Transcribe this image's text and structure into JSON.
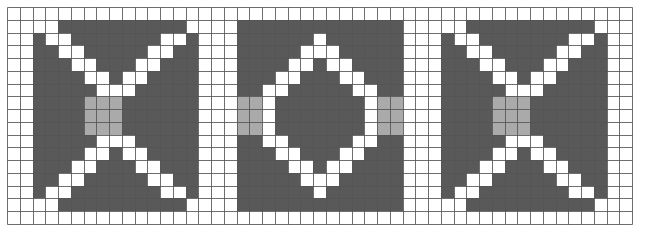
{
  "figure": {
    "title": "",
    "background_color": "#ffffff",
    "width": 647,
    "height": 232
  },
  "grid": {
    "origin_x": 7,
    "origin_y": 7,
    "cell_size": 12.76,
    "columns": 49,
    "rows": 17,
    "line_color": "#555555",
    "line_width": 1,
    "grid_visible": true
  },
  "palette": {
    "empty": "#ffffff",
    "dark": "#595959",
    "mid": "#aaaaaa",
    "highlight": "#ffffff",
    "border": "#555555"
  },
  "chart_data": {
    "type": "heatmap",
    "title": "",
    "subtitle": "",
    "xlabel": "",
    "ylabel": "",
    "legend": [],
    "grid": true,
    "legend_position": "none",
    "xlim": [
      0,
      49
    ],
    "ylim": [
      0,
      17
    ],
    "value_labels": {
      "0": "empty",
      "1": "dark",
      "2": "mid",
      "3": "highlight"
    },
    "value_colors": {
      "0": "#ffffff",
      "1": "#595959",
      "2": "#aaaaaa",
      "3": "#ffffff"
    },
    "panels": [
      {
        "name": "panel-left-bowtie",
        "col_offset": 2,
        "row_offset": 1,
        "width": 13,
        "height": 15
      },
      {
        "name": "panel-middle-diamond",
        "col_offset": 18,
        "row_offset": 1,
        "width": 13,
        "height": 15
      },
      {
        "name": "panel-right-bowtie",
        "col_offset": 34,
        "row_offset": 1,
        "width": 13,
        "height": 15
      }
    ],
    "cells": [
      [
        0,
        0,
        0,
        0,
        0,
        0,
        0,
        0,
        0,
        0,
        0,
        0,
        0,
        0,
        0,
        0,
        0,
        0,
        0,
        0,
        0,
        0,
        0,
        0,
        0,
        0,
        0,
        0,
        0,
        0,
        0,
        0,
        0,
        0,
        0,
        0,
        0,
        0,
        0,
        0,
        0,
        0,
        0,
        0,
        0,
        0,
        0,
        0,
        0
      ],
      [
        0,
        0,
        0,
        0,
        1,
        1,
        1,
        1,
        1,
        1,
        1,
        1,
        1,
        1,
        0,
        0,
        0,
        0,
        1,
        1,
        1,
        1,
        1,
        1,
        1,
        1,
        1,
        1,
        1,
        1,
        1,
        0,
        0,
        0,
        0,
        0,
        1,
        1,
        1,
        1,
        1,
        1,
        1,
        1,
        1,
        1,
        0,
        0,
        0
      ],
      [
        0,
        0,
        1,
        3,
        3,
        1,
        1,
        1,
        1,
        1,
        1,
        1,
        3,
        3,
        1,
        0,
        0,
        0,
        1,
        1,
        1,
        1,
        1,
        1,
        3,
        1,
        1,
        1,
        1,
        1,
        1,
        0,
        0,
        0,
        1,
        3,
        3,
        1,
        1,
        1,
        1,
        1,
        1,
        1,
        3,
        3,
        1,
        0,
        0
      ],
      [
        0,
        0,
        1,
        1,
        3,
        3,
        1,
        1,
        1,
        1,
        1,
        3,
        3,
        1,
        1,
        0,
        0,
        0,
        1,
        1,
        1,
        1,
        1,
        3,
        3,
        3,
        1,
        1,
        1,
        1,
        1,
        0,
        0,
        0,
        1,
        1,
        3,
        3,
        1,
        1,
        1,
        1,
        1,
        3,
        3,
        1,
        1,
        0,
        0
      ],
      [
        0,
        0,
        1,
        1,
        1,
        3,
        3,
        1,
        1,
        1,
        3,
        3,
        1,
        1,
        1,
        0,
        0,
        0,
        1,
        1,
        1,
        1,
        3,
        3,
        1,
        3,
        3,
        1,
        1,
        1,
        1,
        0,
        0,
        0,
        1,
        1,
        1,
        3,
        3,
        1,
        1,
        1,
        3,
        3,
        1,
        1,
        1,
        0,
        0
      ],
      [
        0,
        0,
        1,
        1,
        1,
        1,
        3,
        3,
        1,
        3,
        3,
        1,
        1,
        1,
        1,
        0,
        0,
        0,
        1,
        1,
        1,
        3,
        3,
        1,
        1,
        1,
        3,
        3,
        1,
        1,
        1,
        0,
        0,
        0,
        1,
        1,
        1,
        1,
        3,
        3,
        1,
        3,
        3,
        1,
        1,
        1,
        1,
        0,
        0
      ],
      [
        0,
        0,
        1,
        1,
        1,
        1,
        1,
        3,
        3,
        3,
        1,
        1,
        1,
        1,
        1,
        0,
        0,
        0,
        1,
        1,
        3,
        3,
        1,
        1,
        1,
        1,
        1,
        3,
        3,
        1,
        1,
        0,
        0,
        0,
        1,
        1,
        1,
        1,
        1,
        3,
        3,
        3,
        1,
        1,
        1,
        1,
        1,
        0,
        0
      ],
      [
        0,
        0,
        1,
        1,
        1,
        1,
        2,
        2,
        2,
        1,
        1,
        1,
        1,
        1,
        1,
        0,
        0,
        0,
        2,
        2,
        3,
        1,
        1,
        1,
        1,
        1,
        1,
        1,
        3,
        2,
        2,
        0,
        0,
        0,
        1,
        1,
        1,
        1,
        2,
        2,
        2,
        1,
        1,
        1,
        1,
        1,
        1,
        0,
        0
      ],
      [
        0,
        0,
        1,
        1,
        1,
        1,
        2,
        2,
        2,
        1,
        1,
        1,
        1,
        1,
        1,
        0,
        0,
        0,
        2,
        2,
        3,
        1,
        1,
        1,
        1,
        1,
        1,
        1,
        3,
        2,
        2,
        0,
        0,
        0,
        1,
        1,
        1,
        1,
        2,
        2,
        2,
        1,
        1,
        1,
        1,
        1,
        1,
        0,
        0
      ],
      [
        0,
        0,
        1,
        1,
        1,
        1,
        2,
        2,
        2,
        1,
        1,
        1,
        1,
        1,
        1,
        0,
        0,
        0,
        2,
        2,
        3,
        1,
        1,
        1,
        1,
        1,
        1,
        1,
        3,
        2,
        2,
        0,
        0,
        0,
        1,
        1,
        1,
        1,
        2,
        2,
        2,
        1,
        1,
        1,
        1,
        1,
        1,
        0,
        0
      ],
      [
        0,
        0,
        1,
        1,
        1,
        1,
        1,
        3,
        3,
        3,
        1,
        1,
        1,
        1,
        1,
        0,
        0,
        0,
        1,
        1,
        3,
        3,
        1,
        1,
        1,
        1,
        1,
        3,
        3,
        1,
        1,
        0,
        0,
        0,
        1,
        1,
        1,
        1,
        1,
        3,
        3,
        3,
        1,
        1,
        1,
        1,
        1,
        0,
        0
      ],
      [
        0,
        0,
        1,
        1,
        1,
        1,
        3,
        3,
        1,
        3,
        3,
        1,
        1,
        1,
        1,
        0,
        0,
        0,
        1,
        1,
        1,
        3,
        3,
        1,
        1,
        1,
        3,
        3,
        1,
        1,
        1,
        0,
        0,
        0,
        1,
        1,
        1,
        1,
        3,
        3,
        1,
        3,
        3,
        1,
        1,
        1,
        1,
        0,
        0
      ],
      [
        0,
        0,
        1,
        1,
        1,
        3,
        3,
        1,
        1,
        1,
        3,
        3,
        1,
        1,
        1,
        0,
        0,
        0,
        1,
        1,
        1,
        1,
        3,
        3,
        1,
        3,
        3,
        1,
        1,
        1,
        1,
        0,
        0,
        0,
        1,
        1,
        1,
        3,
        3,
        1,
        1,
        1,
        3,
        3,
        1,
        1,
        1,
        0,
        0
      ],
      [
        0,
        0,
        1,
        1,
        3,
        3,
        1,
        1,
        1,
        1,
        1,
        3,
        3,
        1,
        1,
        0,
        0,
        0,
        1,
        1,
        1,
        1,
        1,
        3,
        3,
        3,
        1,
        1,
        1,
        1,
        1,
        0,
        0,
        0,
        1,
        1,
        3,
        3,
        1,
        1,
        1,
        1,
        1,
        3,
        3,
        1,
        1,
        0,
        0
      ],
      [
        0,
        0,
        1,
        3,
        3,
        1,
        1,
        1,
        1,
        1,
        1,
        1,
        3,
        3,
        1,
        0,
        0,
        0,
        1,
        1,
        1,
        1,
        1,
        1,
        3,
        1,
        1,
        1,
        1,
        1,
        1,
        0,
        0,
        0,
        1,
        3,
        3,
        1,
        1,
        1,
        1,
        1,
        1,
        1,
        3,
        3,
        1,
        0,
        0
      ],
      [
        0,
        0,
        0,
        0,
        1,
        1,
        1,
        1,
        1,
        1,
        1,
        1,
        1,
        1,
        0,
        0,
        0,
        0,
        1,
        1,
        1,
        1,
        1,
        1,
        1,
        1,
        1,
        1,
        1,
        1,
        1,
        0,
        0,
        0,
        0,
        0,
        1,
        1,
        1,
        1,
        1,
        1,
        1,
        1,
        1,
        1,
        0,
        0,
        0
      ],
      [
        0,
        0,
        0,
        0,
        0,
        0,
        0,
        0,
        0,
        0,
        0,
        0,
        0,
        0,
        0,
        0,
        0,
        0,
        0,
        0,
        0,
        0,
        0,
        0,
        0,
        0,
        0,
        0,
        0,
        0,
        0,
        0,
        0,
        0,
        0,
        0,
        0,
        0,
        0,
        0,
        0,
        0,
        0,
        0,
        0,
        0,
        0,
        0,
        0
      ]
    ]
  }
}
